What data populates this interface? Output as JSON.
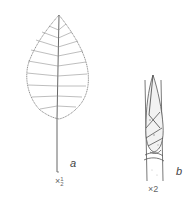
{
  "figure": {
    "panels": [
      {
        "id": "a",
        "label": "a",
        "subject": "leaf",
        "scale": "×½",
        "scale_prefix": "×",
        "scale_num": "1",
        "scale_den": "2"
      },
      {
        "id": "b",
        "label": "b",
        "subject": "bud",
        "scale": "×2",
        "scale_prefix": "×",
        "scale_value": "2"
      }
    ],
    "colors": {
      "line": "#555555",
      "shade": "#bbbbbb",
      "background": "#ffffff"
    }
  }
}
